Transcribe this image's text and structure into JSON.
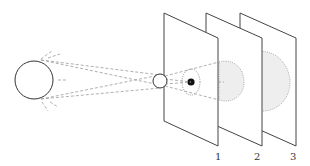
{
  "diagram": {
    "title": "",
    "source": {
      "name": "extended-light-source"
    },
    "aperture": {
      "name": "pinhole-aperture"
    },
    "screens": [
      {
        "label": "1",
        "shadow": "umbra-dark-spot"
      },
      {
        "label": "2",
        "shadow": "larger-faint-spot"
      },
      {
        "label": "3",
        "shadow": "largest-faint-spot"
      }
    ],
    "colors": {
      "line": "#444444",
      "dash": "#9a9a9a",
      "spot_fill": "#eeeeee",
      "umbra": "#111111"
    }
  }
}
